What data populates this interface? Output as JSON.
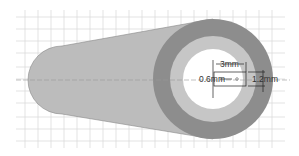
{
  "diagram": {
    "type": "mechanical-cross-section",
    "labels": {
      "width_dim": "3mm",
      "height_dim": "1.2mm",
      "offset_dim": "0.6mm"
    },
    "colors": {
      "grid": "#d8d8d8",
      "body": "#b9b9b9",
      "outer_ring": "#8a8a8a",
      "middle_ring": "#c4c4c4",
      "inner_bore": "#ffffff",
      "dimension_lines": "#222222"
    }
  }
}
